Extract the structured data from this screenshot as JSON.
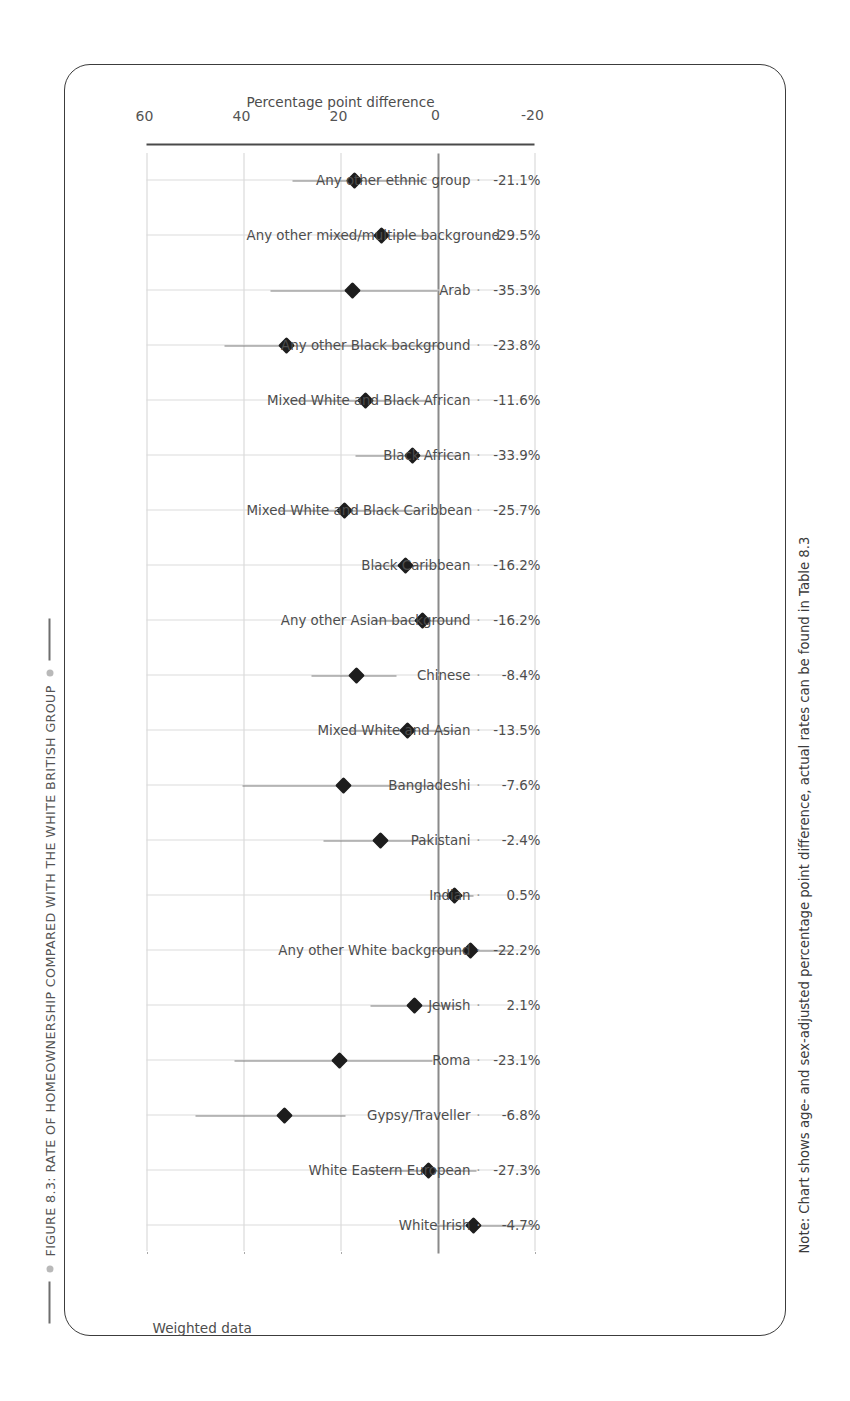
{
  "figure": {
    "title": "FIGURE 8.3: RATE OF HOMEOWNERSHIP COMPARED WITH THE WHITE BRITISH GROUP",
    "annotation": "Weighted data",
    "note": "Note: Chart shows age- and sex-adjusted percentage point difference, actual rates can be found in Table 8.3",
    "separator": "·"
  },
  "chart_data": {
    "type": "scatter",
    "title": "FIGURE 8.3: RATE OF HOMEOWNERSHIP COMPARED WITH THE WHITE BRITISH GROUP",
    "orientation": "vertical-markers-with-error-bars",
    "xlabel": "",
    "ylabel": "Percentage point difference",
    "ylim": [
      -20,
      60
    ],
    "yticks": [
      -20,
      0,
      20,
      40,
      60
    ],
    "ytick_labels": [
      "-20",
      "0",
      "20",
      "40",
      "60"
    ],
    "grid": true,
    "legend": "none",
    "zero_reference_line": 0,
    "categories": [
      "White Irish",
      "White Eastern European",
      "Gypsy/Traveller",
      "Roma",
      "Jewish",
      "Any other White background",
      "Indian",
      "Pakistani",
      "Bangladeshi",
      "Mixed White and Asian",
      "Chinese",
      "Any other Asian background",
      "Black Caribbean",
      "Mixed White and Black Caribbean",
      "Black African",
      "Mixed White and Black African",
      "Any other Black background",
      "Arab",
      "Any other mixed/multiple background",
      "Any other ethnic group"
    ],
    "value_labels": [
      "-4.7%",
      "-27.3%",
      "-6.8%",
      "-23.1%",
      "2.1%",
      "-22.2%",
      "0.5%",
      "-2.4%",
      "-7.6%",
      "-13.5%",
      "-8.4%",
      "-16.2%",
      "-16.2%",
      "-25.7%",
      "-33.9%",
      "-11.6%",
      "-23.8%",
      "-35.3%",
      "-29.5%",
      "-21.1%"
    ],
    "values": [
      -7.5,
      1.8,
      31.5,
      20.3,
      4.8,
      -6.9,
      -3.6,
      11.8,
      19.3,
      6.2,
      16.6,
      3.1,
      6.5,
      19.1,
      5.2,
      14.8,
      31.2,
      17.5,
      11.5,
      17.2
    ],
    "ci_low": [
      -20.2,
      -8.0,
      19.0,
      1.0,
      -4.5,
      -14.8,
      -7.5,
      1.0,
      0.4,
      -4.0,
      8.4,
      -5.2,
      0.0,
      3.2,
      -4.4,
      1.5,
      -0.5,
      0.0,
      1.5,
      2.6
    ],
    "ci_high": [
      0.6,
      14.8,
      50.0,
      41.8,
      13.8,
      1.2,
      0.2,
      23.5,
      40.2,
      18.4,
      26.0,
      13.0,
      13.5,
      32.5,
      17.0,
      30.4,
      44.0,
      34.5,
      22.5,
      30.0
    ],
    "series": [
      {
        "name": "Age- and sex-adjusted percentage point difference",
        "values": [
          -7.5,
          1.8,
          31.5,
          20.3,
          4.8,
          -6.9,
          -3.6,
          11.8,
          19.3,
          6.2,
          16.6,
          3.1,
          6.5,
          19.1,
          5.2,
          14.8,
          31.2,
          17.5,
          11.5,
          17.2
        ]
      }
    ]
  },
  "colors": {
    "marker": "#1d1d1d",
    "error_bar": "#7d7d7d",
    "grid": "#a8a8a8",
    "axis": "#4a4a4a",
    "text": "#4d4d4d",
    "title": "#545454",
    "frame": "#3c3c3c"
  }
}
